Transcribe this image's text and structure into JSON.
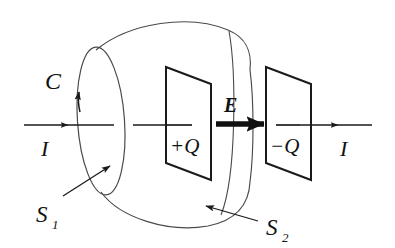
{
  "figure": {
    "kind": "physics-diagram",
    "stroke_color": "#1a1a1a",
    "thin_stroke_color": "#4a4a4a",
    "background_color": "#ffffff"
  },
  "labels": {
    "loop_curve": "C",
    "current_left": "I",
    "current_right": "I",
    "efield": "E",
    "charge_positive": "+Q",
    "charge_negative": "−Q",
    "surface_flat": "S",
    "surface_flat_sub": "1",
    "surface_bag": "S",
    "surface_bag_sub": "2"
  },
  "elements": {
    "wire_left_label": "I",
    "wire_right_label": "I",
    "left_plate_label": "+Q",
    "right_plate_label": "−Q",
    "loop_label": "C",
    "field_label": "E"
  }
}
